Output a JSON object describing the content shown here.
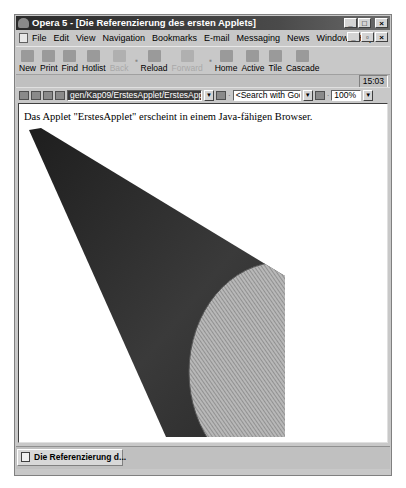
{
  "window": {
    "title": "Opera 5 - [Die Referenzierung des ersten Applets]",
    "controls": {
      "minimize": "_",
      "maximize": "□",
      "close": "×"
    },
    "mdi_controls": {
      "minimize": "_",
      "restore": "▫",
      "close": "×"
    }
  },
  "menu": {
    "items": [
      "File",
      "Edit",
      "View",
      "Navigation",
      "Bookmarks",
      "E-mail",
      "Messaging",
      "News",
      "Window",
      "Help"
    ]
  },
  "toolbar": {
    "buttons": [
      {
        "label": "New",
        "icon": "new-page-icon",
        "enabled": true
      },
      {
        "label": "Print",
        "icon": "printer-icon",
        "enabled": true
      },
      {
        "label": "Find",
        "icon": "find-icon",
        "enabled": true
      },
      {
        "label": "Hotlist",
        "icon": "hotlist-icon",
        "enabled": true
      },
      {
        "label": "Back",
        "icon": "back-arrow-icon",
        "enabled": false
      },
      {
        "label": "Reload",
        "icon": "reload-icon",
        "enabled": true
      },
      {
        "label": "Forward",
        "icon": "forward-arrow-icon",
        "enabled": false
      },
      {
        "label": "Home",
        "icon": "home-icon",
        "enabled": true
      },
      {
        "label": "Active",
        "icon": "active-icon",
        "enabled": true
      },
      {
        "label": "Tile",
        "icon": "tile-icon",
        "enabled": true
      },
      {
        "label": "Cascade",
        "icon": "cascade-icon",
        "enabled": true
      }
    ]
  },
  "status": {
    "clock": "15:03"
  },
  "address_bar": {
    "url": "gen/Kap09/ErstesApplet/ErstesApplet.html",
    "search": "<Search with Google>",
    "zoom": "100%"
  },
  "page": {
    "text": "Das Applet \"ErstesApplet\" erscheint in einem Java-fähigen Browser."
  },
  "tabs": [
    {
      "label": "Die Referenzierung d..."
    }
  ],
  "colors": {
    "titlebar": "#2a2a2a",
    "chrome": "#c8c8c8",
    "content_bg": "#ffffff",
    "cone_dark": "#2e2e2e",
    "cone_light": "#9a9a9a"
  }
}
